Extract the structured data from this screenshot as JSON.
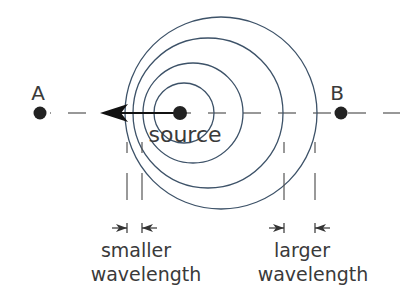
{
  "diagram": {
    "colors": {
      "wavefront": "#3d5268",
      "text": "#3a3a3a",
      "dot": "#222222",
      "arrow": "#111111"
    },
    "points": {
      "a": {
        "label": "A",
        "x": 40,
        "y": 113
      },
      "b": {
        "label": "B",
        "x": 341,
        "y": 113
      },
      "source": {
        "label": "source",
        "x": 180,
        "y": 113
      }
    },
    "wavefronts": [
      {
        "cx": 184,
        "cy": 113,
        "r": 30
      },
      {
        "cx": 193,
        "cy": 113,
        "r": 50
      },
      {
        "cx": 208,
        "cy": 113,
        "r": 75
      },
      {
        "cx": 221,
        "cy": 113,
        "r": 95
      }
    ],
    "velocity_arrow": {
      "from_x": 180,
      "to_x": 100,
      "y": 113,
      "direction": "left"
    },
    "annotations": {
      "left": {
        "line1": "smaller",
        "line2": "wavelength",
        "tick_x": [
          127,
          142
        ]
      },
      "right": {
        "line1": "larger",
        "line2": "wavelength",
        "tick_x": [
          284,
          315
        ]
      }
    }
  }
}
